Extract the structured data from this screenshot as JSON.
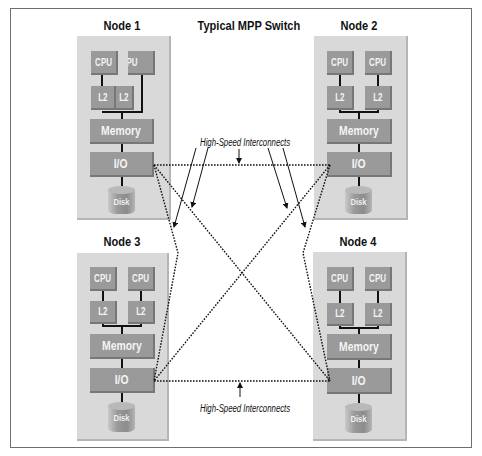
{
  "diagram": {
    "title": "Typical MPP Switch",
    "interconnect_label_top": "High-Speed Interconnects",
    "interconnect_label_bottom": "High-Speed Interconnects",
    "nodes": [
      {
        "name": "Node 1",
        "cpus": [
          "CPU",
          "PU"
        ],
        "caches": [
          "L2",
          "L2"
        ],
        "memory": "Memory",
        "io": "I/O",
        "disk": "Disk"
      },
      {
        "name": "Node 2",
        "cpus": [
          "CPU",
          "CPU"
        ],
        "caches": [
          "L2",
          "L2"
        ],
        "memory": "Memory",
        "io": "I/O",
        "disk": "Disk"
      },
      {
        "name": "Node 3",
        "cpus": [
          "CPU",
          "CPU"
        ],
        "caches": [
          "L2",
          "L2"
        ],
        "memory": "Memory",
        "io": "I/O",
        "disk": "Disk"
      },
      {
        "name": "Node 4",
        "cpus": [
          "CPU",
          "CPU"
        ],
        "caches": [
          "L2",
          "L2"
        ],
        "memory": "Memory",
        "io": "I/O",
        "disk": "Disk"
      }
    ],
    "connections": [
      {
        "from": "Node 1",
        "to": "Node 2",
        "style": "dotted"
      },
      {
        "from": "Node 3",
        "to": "Node 4",
        "style": "dotted"
      },
      {
        "from": "Node 1",
        "to": "Node 3",
        "style": "dotted"
      },
      {
        "from": "Node 2",
        "to": "Node 4",
        "style": "dotted"
      },
      {
        "from": "Node 1",
        "to": "Node 4",
        "style": "dotted"
      },
      {
        "from": "Node 2",
        "to": "Node 3",
        "style": "dotted"
      }
    ],
    "colors": {
      "panel": "#d9d9d9",
      "block": "#9a9a9a",
      "block_text": "#f4f4f4",
      "frame": "#6e6e6e",
      "line": "#111111"
    }
  }
}
